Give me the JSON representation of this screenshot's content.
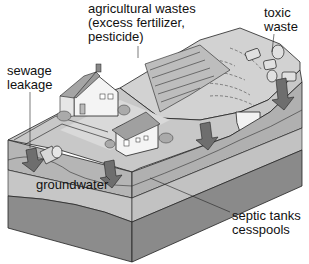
{
  "diagram": {
    "labels": {
      "agricultural": {
        "line1": "agricultural wastes",
        "line2": "(excess fertilizer,",
        "line3": "pesticide)"
      },
      "toxic": {
        "line1": "toxic",
        "line2": "waste"
      },
      "sewage": {
        "line1": "sewage",
        "line2": "leakage"
      },
      "groundwater": "groundwater",
      "septic": {
        "line1": "septic tanks",
        "line2": "cesspools"
      }
    },
    "colors": {
      "surface_light": "#d6d6d6",
      "surface_mid": "#bdbdbd",
      "soil_layer": "#a8a8a8",
      "groundwater_layer": "#c4c4c4",
      "bedrock": "#8a8a8a",
      "arrow": "#6e6e6e",
      "outline": "#222222",
      "house_wall": "#f4f4f4",
      "roof": "#9a9a9a"
    }
  }
}
